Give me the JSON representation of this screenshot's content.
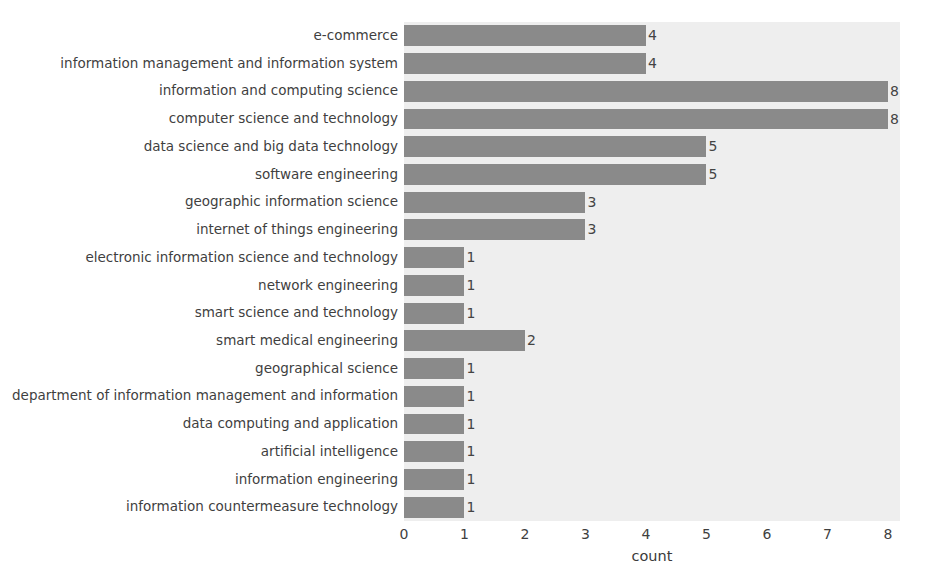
{
  "chart_data": {
    "type": "bar",
    "orientation": "horizontal",
    "title": "",
    "xlabel": "count",
    "ylabel": "Programme",
    "xlim": [
      0,
      8.2
    ],
    "xticks": [
      0,
      1,
      2,
      3,
      4,
      5,
      6,
      7,
      8
    ],
    "xtick_labels": [
      "0",
      "1",
      "2",
      "3",
      "4",
      "5",
      "6",
      "7",
      "8"
    ],
    "grid": false,
    "legend": null,
    "bar_color": "#8a8a8a",
    "plot_background": "#eeeeee",
    "figure_background": "#ffffff",
    "show_value_labels": true,
    "categories": [
      "e-commerce",
      "information management and information system",
      "information and computing science",
      "computer science and technology",
      "data science and big data technology",
      "software engineering",
      "geographic information science",
      "internet of things engineering",
      "electronic information science and technology",
      "network engineering",
      "smart science and technology",
      "smart medical engineering",
      "geographical science",
      "department of information management and information",
      "data computing and application",
      "artificial intelligence",
      "information engineering",
      "information countermeasure technology"
    ],
    "values": [
      4,
      4,
      8,
      8,
      5,
      5,
      3,
      3,
      1,
      1,
      1,
      2,
      1,
      1,
      1,
      1,
      1,
      1
    ],
    "value_labels": [
      "4",
      "4",
      "8",
      "8",
      "5",
      "5",
      "3",
      "3",
      "1",
      "1",
      "1",
      "2",
      "1",
      "1",
      "1",
      "1",
      "1",
      "1"
    ]
  }
}
